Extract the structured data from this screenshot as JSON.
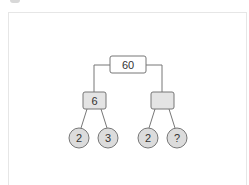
{
  "diagram": {
    "type": "factor-tree",
    "colors": {
      "line": "#666666",
      "root_fill": "#ffffff",
      "box_fill": "#e4e4e4",
      "circle_fill": "#dcdcdc",
      "stroke": "#777777",
      "text": "#333333"
    },
    "root": {
      "label": "60"
    },
    "level1": [
      {
        "label": "6"
      },
      {
        "label": ""
      }
    ],
    "level2": [
      {
        "label": "2"
      },
      {
        "label": "3"
      },
      {
        "label": "2"
      },
      {
        "label": "?"
      }
    ]
  }
}
